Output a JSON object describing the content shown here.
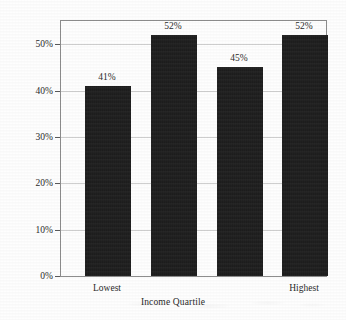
{
  "chart_data": {
    "type": "bar",
    "title": "",
    "categories": [
      "Lowest",
      "",
      "",
      "Highest"
    ],
    "values": [
      41,
      52,
      45,
      52
    ],
    "value_labels": [
      "41%",
      "52%",
      "45%",
      "52%"
    ],
    "xlabel": "Income Quartile",
    "ylabel": "Agreeing with Employer Messages",
    "ylim": [
      0,
      55
    ],
    "yticks": [
      0,
      10,
      20,
      30,
      40,
      50
    ],
    "ytick_labels": [
      "0%",
      "10%",
      "20%",
      "30%",
      "40%",
      "50%"
    ],
    "grid": true,
    "legend": false,
    "bar_color": "#1c1c1c",
    "background_color": "#fefefe",
    "gridline_color": "#cfcfcf",
    "axis_color": "#8d8d8d"
  }
}
